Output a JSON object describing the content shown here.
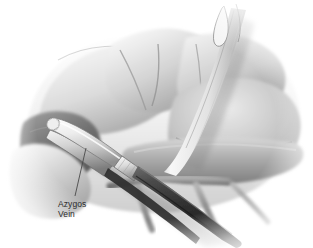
{
  "figure": {
    "title": "Azygos Vein",
    "medium": "grayscale medical line-and-wash illustration",
    "background_color": "#ffffff"
  },
  "labels": [
    {
      "id": "azygos-vein",
      "line1": "Azygos",
      "line2": "Vein",
      "text_color": "#2b2b2b",
      "leader_line": {
        "from_x": 75,
        "from_y": 196,
        "to_x": 86,
        "to_y": 148,
        "color": "#4a4a4a"
      }
    }
  ],
  "palette": {
    "background": "#ffffff",
    "tissue_light": "#f2f2f2",
    "tissue_mid": "#c8c8c8",
    "tissue_shadow": "#8e8e8e",
    "tissue_deep": "#6a6a6a",
    "cavity_dark": "#5c5c5c",
    "instrument_light": "#e6e6e6",
    "instrument_mid": "#b4b4b4",
    "instrument_dark": "#3c3c3c",
    "instrument_darkest": "#2a2a2a",
    "outline": "#4a4a4a"
  },
  "scene": {
    "structures": [
      {
        "name": "upper-tissue-lobe-left",
        "tone": "#d8d8d8"
      },
      {
        "name": "upper-tissue-lobe-center",
        "tone": "#cfcfcf"
      },
      {
        "name": "upper-tissue-lobe-right",
        "tone": "#c6c6c6"
      },
      {
        "name": "right-tissue-mass",
        "tone": "#bdbdbd"
      },
      {
        "name": "lower-tissue-band",
        "tone": "#a8a8a8"
      },
      {
        "name": "left-cavity-recess",
        "tone": "#6f6f6f"
      },
      {
        "name": "vessel-branch-lower-left",
        "tone": "#8a8a8a"
      },
      {
        "name": "vessel-branch-lower-center",
        "tone": "#808080"
      },
      {
        "name": "vessel-branch-lower-right",
        "tone": "#7a7a7a"
      }
    ],
    "instruments": [
      {
        "name": "surgical-stapler",
        "position": "lower-left-to-lower-right-diagonal",
        "jaw_tone": "#e2e2e2",
        "collar_tone": "#d0d0d0",
        "shaft_tone": "#3a3a3a"
      },
      {
        "name": "retractor-band",
        "position": "upper-right-descending",
        "tone": "#ececec"
      }
    ]
  }
}
